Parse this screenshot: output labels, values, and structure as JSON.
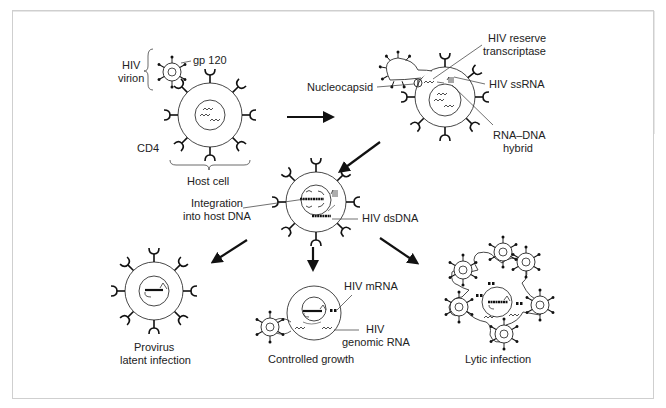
{
  "diagram": {
    "border_color": "#cccccc",
    "stroke_color": "#222222",
    "stages": {
      "attachment": {
        "virion_label_1": "HIV",
        "virion_label_2": "virion",
        "gp120_label": "gp 120",
        "cd4_label": "CD4",
        "host_cell_label": "Host cell"
      },
      "entry": {
        "nucleocapsid_label": "Nucleocapsid",
        "rt_label_1": "HIV reserve",
        "rt_label_2": "transcriptase",
        "ssrna_label": "HIV ssRNA",
        "hybrid_label_1": "RNA–DNA",
        "hybrid_label_2": "hybrid"
      },
      "integration": {
        "integration_label_1": "Integration",
        "integration_label_2": "into host DNA",
        "dsdna_label": "HIV dsDNA"
      },
      "outcomes": [
        {
          "id": "latent",
          "label_1": "Provirus",
          "label_2": "latent infection"
        },
        {
          "id": "controlled",
          "label_1": "Controlled growth",
          "mrna_label": "HIV mRNA",
          "genomic_label_1": "HIV",
          "genomic_label_2": "genomic RNA"
        },
        {
          "id": "lytic",
          "label_1": "Lytic infection"
        }
      ]
    }
  }
}
